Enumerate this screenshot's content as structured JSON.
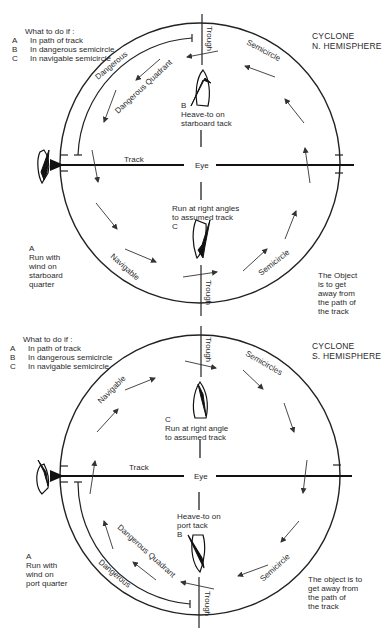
{
  "north": {
    "title_line1": "CYCLONE",
    "title_line2": "N. HEMISPHERE",
    "legend": {
      "heading": "What to do if :",
      "items": [
        {
          "key": "A",
          "text": "In path of track"
        },
        {
          "key": "B",
          "text": "In dangerous semicircle"
        },
        {
          "key": "C",
          "text": "In navigable semicircle"
        }
      ]
    },
    "labels": {
      "trough_top": "Trough",
      "trough_bottom": "Trough",
      "semicircle_top": "Semicircle",
      "semicircle_bottom": "Semicircle",
      "dangerous": "Dangerous",
      "dangerous_quadrant": "Dangerous Quadrant",
      "navigable": "Navigable",
      "track": "Track",
      "eye": "Eye"
    },
    "actions": {
      "b_key": "B",
      "b_line1": "Heave-to on",
      "b_line2": "starboard tack",
      "c_line1": "Run at right angles",
      "c_line2": "to assumed track",
      "c_key": "C",
      "a_key": "A",
      "a_line1": "Run with",
      "a_line2": "wind on",
      "a_line3": "starboard",
      "a_line4": "quarter"
    },
    "note": {
      "line1": "The Object",
      "line2": "is to get",
      "line3": "away from",
      "line4": "the path of",
      "line5": "the track"
    }
  },
  "south": {
    "title_line1": "CYCLONE",
    "title_line2": "S. HEMISPHERE",
    "legend": {
      "heading": "What to do if :",
      "items": [
        {
          "key": "A",
          "text": "In path of track"
        },
        {
          "key": "B",
          "text": "In dangerous semicircle"
        },
        {
          "key": "C",
          "text": "In navigable semicircle"
        }
      ]
    },
    "labels": {
      "trough_top": "Trough",
      "trough_bottom": "Trough",
      "semicircles_top": "Semicircles",
      "semicircle_bottom": "Semicircle",
      "navigable": "Navigable",
      "dangerous_quadrant": "Dangerous Quadrant",
      "dangerous": "Dangerous",
      "track": "Track",
      "eye": "Eye"
    },
    "actions": {
      "c_key": "C",
      "c_line1": "Run at right angle",
      "c_line2": "to assumed track",
      "b_line1": "Heave-to on",
      "b_line2": "port tack",
      "b_key": "B",
      "a_key": "A",
      "a_line1": "Run with",
      "a_line2": "wind on",
      "a_line3": "port quarter"
    },
    "note": {
      "line1": "The object is to",
      "line2": "get away from",
      "line3": "the path of",
      "line4": "the track"
    }
  }
}
